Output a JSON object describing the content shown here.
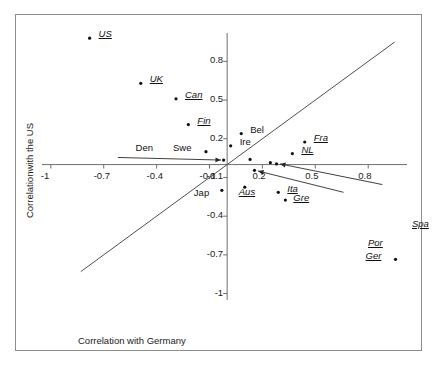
{
  "chart_data": {
    "type": "scatter",
    "title": "",
    "xlabel": "Correlation with Germany",
    "ylabel": "Correlationwith the US",
    "xlim": [
      -1.05,
      1.02
    ],
    "ylim": [
      -1.05,
      1.02
    ],
    "xticks": [
      -1,
      -0.7,
      -0.4,
      -0.1,
      0.2,
      0.5,
      0.8
    ],
    "yticks": [
      0.8,
      0.5,
      0.2,
      -0.1,
      -0.4,
      -0.7,
      -1
    ],
    "xticklabels": [
      "-1",
      "-0.7",
      "-0.4",
      "-0.1",
      "0.2",
      "0.5",
      "0.8"
    ],
    "yticklabels": [
      "0.8",
      "0.5",
      "0.2",
      "-0.1",
      "-0.4",
      "-0.7",
      "-1"
    ],
    "grid": false,
    "legend": null,
    "axes_style": "centered-cross",
    "reference_line": {
      "name": "identity-line",
      "equation": "y = x",
      "x_from": -0.83,
      "y_from": -0.83,
      "x_to": 0.95,
      "y_to": 0.95
    },
    "points": [
      {
        "label": "US",
        "x": -0.78,
        "y": 0.98,
        "style": "italic-underline",
        "label_dx": 9,
        "label_dy": -4,
        "leader": null
      },
      {
        "label": "UK",
        "x": -0.49,
        "y": 0.63,
        "style": "italic-underline",
        "label_dx": 9,
        "label_dy": -4,
        "leader": null
      },
      {
        "label": "Can",
        "x": -0.29,
        "y": 0.51,
        "style": "italic-underline",
        "label_dx": 9,
        "label_dy": -4,
        "leader": null
      },
      {
        "label": "Fin",
        "x": -0.22,
        "y": 0.31,
        "style": "italic-underline",
        "label_dx": 9,
        "label_dy": -4,
        "leader": null
      },
      {
        "label": "Bel",
        "x": 0.08,
        "y": 0.24,
        "style": "plain",
        "label_dx": 9,
        "label_dy": -4,
        "leader": null
      },
      {
        "label": "Ire",
        "x": 0.02,
        "y": 0.145,
        "style": "plain",
        "label_dx": 9,
        "label_dy": -4,
        "leader": null
      },
      {
        "label": "Swe",
        "x": -0.12,
        "y": 0.1,
        "style": "plain",
        "label_dx": -33,
        "label_dy": -4,
        "leader": null
      },
      {
        "label": "Fra",
        "x": 0.44,
        "y": 0.175,
        "style": "italic-underline",
        "label_dx": 9,
        "label_dy": -4,
        "leader": null
      },
      {
        "label": "NL",
        "x": 0.37,
        "y": 0.085,
        "style": "italic-underline",
        "label_dx": 9,
        "label_dy": -4,
        "leader": null
      },
      {
        "label": "Den",
        "x": -0.02,
        "y": 0.035,
        "style": "plain",
        "label_dx": -88,
        "label_dy": -12,
        "leader": {
          "from_x": -0.62,
          "from_y": 0.055,
          "to_x": -0.035,
          "to_y": 0.035
        }
      },
      {
        "label": "Jap",
        "x": -0.03,
        "y": -0.2,
        "style": "plain",
        "label_dx": -28,
        "label_dy": 3,
        "leader": null
      },
      {
        "label": "Aus",
        "x": 0.1,
        "y": -0.175,
        "style": "italic-underline",
        "label_dx": -6,
        "label_dy": 5,
        "leader": null
      },
      {
        "label": "Ita",
        "x": 0.29,
        "y": -0.215,
        "style": "italic-underline",
        "label_dx": 9,
        "label_dy": -3,
        "leader": null
      },
      {
        "label": "Gre",
        "x": 0.33,
        "y": -0.275,
        "style": "italic-underline",
        "label_dx": 8,
        "label_dy": -2,
        "leader": null
      },
      {
        "label": "Por",
        "x": 0.155,
        "y": -0.045,
        "style": "italic-underline",
        "label_dx": 0,
        "label_dy": 0,
        "leader": {
          "from_x": 0.66,
          "from_y": -0.215,
          "to_x": 0.175,
          "to_y": -0.05
        },
        "label_px": {
          "x": 352,
          "y": 222
        }
      },
      {
        "label": "Spa",
        "x": 0.28,
        "y": 0.005,
        "style": "italic-underline",
        "label_dx": 0,
        "label_dy": 0,
        "leader": {
          "from_x": 0.88,
          "from_y": -0.155,
          "to_x": 0.3,
          "to_y": 0.005
        },
        "label_px": {
          "x": 396,
          "y": 203
        }
      },
      {
        "label": "Ger",
        "x": 0.955,
        "y": -0.735,
        "style": "italic-underline",
        "label_dx": -30,
        "label_dy": -3,
        "leader": null
      }
    ],
    "extra_points": [
      {
        "x": 0.13,
        "y": 0.04
      },
      {
        "x": 0.245,
        "y": 0.015
      }
    ]
  }
}
